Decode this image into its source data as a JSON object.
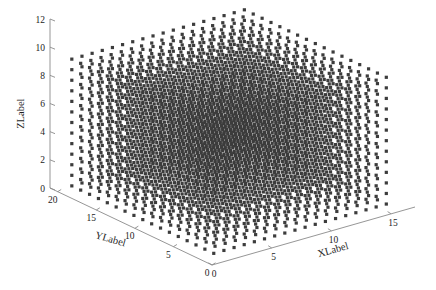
{
  "figure": {
    "background": "#ffffff",
    "width": 436,
    "height": 290,
    "marker_color": "#3c3c3c",
    "axis_color": "#8a8a8a",
    "text_color": "#1d1d1d"
  },
  "chart_data": {
    "type": "scatter",
    "projection": "3d",
    "title": "",
    "xlabel": "XLabel",
    "ylabel": "YLabel",
    "zlabel": "ZLabel",
    "grid": false,
    "legend": null,
    "xlim": [
      0,
      17
    ],
    "ylim": [
      0,
      21
    ],
    "zlim": [
      0,
      12
    ],
    "xticks": [
      0,
      5,
      10,
      15
    ],
    "yticks": [
      0,
      5,
      10,
      15,
      20
    ],
    "zticks": [
      0,
      2,
      4,
      6,
      8,
      10,
      12
    ],
    "xtick_labels": [
      "0",
      "5",
      "10",
      "15"
    ],
    "ytick_labels": [
      "0",
      "5",
      "10",
      "15",
      "20"
    ],
    "ztick_labels": [
      "0",
      "2",
      "4",
      "6",
      "8",
      "10",
      "12"
    ],
    "marker": "point",
    "marker_size": 1.6,
    "lattice": {
      "x_start": 0.6,
      "x_step": 0.85,
      "x_count": 18,
      "y_start": 0.7,
      "y_step": 1.15,
      "y_count": 17,
      "z_start": 0.5,
      "z_step": 0.75,
      "z_count": 13
    },
    "point_count": 3978
  },
  "view": {
    "origin_px": [
      212,
      265
    ],
    "x_axis_end_px": [
      415,
      207
    ],
    "y_axis_end_px": [
      50,
      188
    ],
    "z_axis_top_px": [
      50,
      19
    ],
    "z_axis_bottom_px": [
      50,
      188
    ]
  }
}
